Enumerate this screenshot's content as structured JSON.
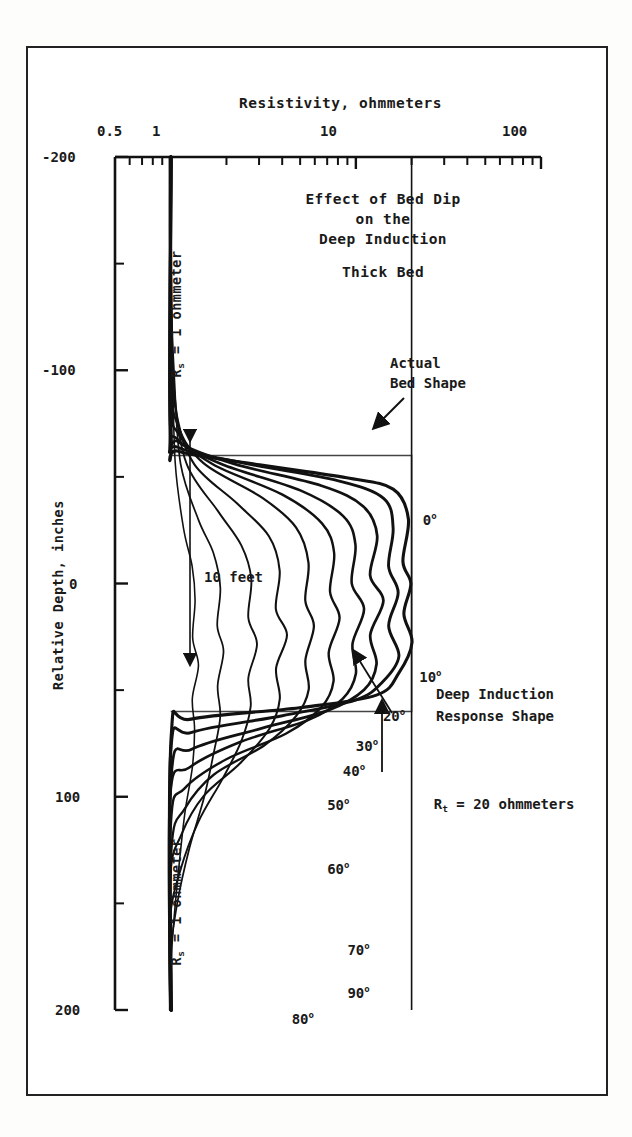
{
  "figure": {
    "title_lines": [
      "Effect of Bed Dip",
      "on the",
      "Deep Induction"
    ],
    "subtitle": "Thick Bed"
  },
  "annotations": {
    "actual_bed_shape": [
      "Actual",
      "Bed Shape"
    ],
    "response_shape": [
      "Deep Induction",
      "Response Shape"
    ],
    "rt_label": "R_t = 20 ohmmeters",
    "rt_label_pre": "R",
    "rt_label_sub": "t",
    "rt_label_post": " = 20 ohmmeters",
    "rs_label_pre": "R",
    "rs_label_sub": "s",
    "rs_label_post": " = 1 ohmmeter",
    "bed_thickness": "10 feet"
  },
  "chart_data": {
    "type": "line",
    "xlabel": "Resistivity, ohmmeters",
    "ylabel": "Relative Depth, inches",
    "xscale": "log",
    "xlim": [
      0.5,
      100
    ],
    "ylim": [
      -200,
      200
    ],
    "y_inverted": true,
    "grid": false,
    "legend": "inline curve labels",
    "xticks": [
      "0.5",
      "1",
      "10",
      "100"
    ],
    "xtick_values": [
      0.5,
      1,
      10,
      100
    ],
    "yticks": [
      "-200",
      "-100",
      "0",
      "100",
      "200"
    ],
    "ytick_values": [
      -200,
      -100,
      0,
      100,
      200
    ],
    "y_minor_tick_step": 50,
    "reference_lines": [
      {
        "name": "Rs shoulder resistivity",
        "x": 1,
        "label": "R_s = 1 ohmmeter"
      },
      {
        "name": "Rt bed resistivity",
        "x": 20,
        "label": "R_t = 20 ohmmeters"
      }
    ],
    "bed": {
      "name": "Actual Bed Shape",
      "top_depth": -60,
      "bottom_depth": 60,
      "thickness_label": "10 feet",
      "rs_ohmmeters": 1,
      "rt_ohmmeters": 20
    },
    "series": [
      {
        "name": "0 deg",
        "label": "0",
        "dip_degrees": 0,
        "points": [
          [
            1,
            -200
          ],
          [
            1,
            -70
          ],
          [
            1.1,
            -62
          ],
          [
            3,
            -56
          ],
          [
            9,
            -50
          ],
          [
            16,
            -44
          ],
          [
            19,
            -30
          ],
          [
            18,
            -10
          ],
          [
            20,
            0
          ],
          [
            18,
            14
          ],
          [
            20,
            28
          ],
          [
            17,
            42
          ],
          [
            13,
            52
          ],
          [
            5,
            58
          ],
          [
            1.3,
            64
          ],
          [
            1,
            72
          ],
          [
            1,
            200
          ]
        ]
      },
      {
        "name": "10 deg",
        "label": "10",
        "dip_degrees": 10,
        "points": [
          [
            1,
            -200
          ],
          [
            1,
            -74
          ],
          [
            1.1,
            -64
          ],
          [
            2.6,
            -56
          ],
          [
            8,
            -48
          ],
          [
            14,
            -40
          ],
          [
            16,
            -26
          ],
          [
            15,
            -8
          ],
          [
            17,
            4
          ],
          [
            15,
            20
          ],
          [
            17,
            34
          ],
          [
            14,
            46
          ],
          [
            10,
            55
          ],
          [
            4,
            62
          ],
          [
            1.3,
            70
          ],
          [
            1,
            80
          ],
          [
            1,
            200
          ]
        ]
      },
      {
        "name": "20 deg",
        "label": "20",
        "dip_degrees": 20,
        "points": [
          [
            1,
            -200
          ],
          [
            1,
            -78
          ],
          [
            1.1,
            -66
          ],
          [
            2.2,
            -56
          ],
          [
            6.5,
            -46
          ],
          [
            11,
            -36
          ],
          [
            13,
            -22
          ],
          [
            12,
            -4
          ],
          [
            14,
            8
          ],
          [
            12,
            24
          ],
          [
            13,
            38
          ],
          [
            11,
            50
          ],
          [
            7,
            60
          ],
          [
            3,
            68
          ],
          [
            1.3,
            78
          ],
          [
            1,
            90
          ],
          [
            1,
            200
          ]
        ]
      },
      {
        "name": "30 deg",
        "label": "30",
        "dip_degrees": 30,
        "points": [
          [
            1,
            -200
          ],
          [
            1,
            -84
          ],
          [
            1.1,
            -68
          ],
          [
            1.9,
            -56
          ],
          [
            5,
            -44
          ],
          [
            8.5,
            -32
          ],
          [
            10,
            -18
          ],
          [
            9.5,
            0
          ],
          [
            11,
            12
          ],
          [
            9.5,
            28
          ],
          [
            10,
            42
          ],
          [
            8.5,
            54
          ],
          [
            5.5,
            64
          ],
          [
            2.4,
            74
          ],
          [
            1.25,
            86
          ],
          [
            1,
            100
          ],
          [
            1,
            200
          ]
        ]
      },
      {
        "name": "40 deg",
        "label": "40",
        "dip_degrees": 40,
        "points": [
          [
            1,
            -200
          ],
          [
            1,
            -90
          ],
          [
            1.1,
            -70
          ],
          [
            1.7,
            -56
          ],
          [
            4,
            -42
          ],
          [
            6.5,
            -28
          ],
          [
            7.6,
            -14
          ],
          [
            7.2,
            4
          ],
          [
            8.2,
            16
          ],
          [
            7.2,
            32
          ],
          [
            7.6,
            46
          ],
          [
            6.5,
            58
          ],
          [
            4.2,
            70
          ],
          [
            2,
            82
          ],
          [
            1.2,
            96
          ],
          [
            1,
            112
          ],
          [
            1,
            200
          ]
        ]
      },
      {
        "name": "50 deg",
        "label": "50",
        "dip_degrees": 50,
        "points": [
          [
            1,
            -200
          ],
          [
            1,
            -98
          ],
          [
            1.1,
            -74
          ],
          [
            1.5,
            -56
          ],
          [
            3.1,
            -40
          ],
          [
            4.8,
            -26
          ],
          [
            5.6,
            -10
          ],
          [
            5.3,
            8
          ],
          [
            6,
            20
          ],
          [
            5.3,
            36
          ],
          [
            5.6,
            50
          ],
          [
            4.8,
            62
          ],
          [
            3.2,
            76
          ],
          [
            1.7,
            90
          ],
          [
            1.18,
            106
          ],
          [
            1,
            124
          ],
          [
            1,
            200
          ]
        ]
      },
      {
        "name": "60 deg",
        "label": "60",
        "dip_degrees": 60,
        "points": [
          [
            1,
            -200
          ],
          [
            1,
            -110
          ],
          [
            1.08,
            -80
          ],
          [
            1.35,
            -56
          ],
          [
            2.3,
            -38
          ],
          [
            3.4,
            -22
          ],
          [
            3.9,
            -6
          ],
          [
            3.7,
            12
          ],
          [
            4.2,
            24
          ],
          [
            3.7,
            40
          ],
          [
            3.9,
            54
          ],
          [
            3.4,
            68
          ],
          [
            2.4,
            84
          ],
          [
            1.5,
            100
          ],
          [
            1.15,
            118
          ],
          [
            1,
            138
          ],
          [
            1,
            200
          ]
        ]
      },
      {
        "name": "70 deg",
        "label": "70",
        "dip_degrees": 70,
        "points": [
          [
            1,
            -200
          ],
          [
            1,
            -126
          ],
          [
            1.06,
            -88
          ],
          [
            1.22,
            -56
          ],
          [
            1.8,
            -34
          ],
          [
            2.4,
            -18
          ],
          [
            2.7,
            -2
          ],
          [
            2.6,
            16
          ],
          [
            2.9,
            28
          ],
          [
            2.6,
            44
          ],
          [
            2.7,
            58
          ],
          [
            2.4,
            74
          ],
          [
            1.9,
            92
          ],
          [
            1.4,
            112
          ],
          [
            1.12,
            134
          ],
          [
            1,
            158
          ],
          [
            1,
            200
          ]
        ]
      },
      {
        "name": "80 deg",
        "label": "80",
        "dip_degrees": 80,
        "points": [
          [
            1,
            -200
          ],
          [
            1,
            -146
          ],
          [
            1.04,
            -96
          ],
          [
            1.12,
            -56
          ],
          [
            1.4,
            -30
          ],
          [
            1.7,
            -14
          ],
          [
            1.85,
            2
          ],
          [
            1.8,
            20
          ],
          [
            1.95,
            32
          ],
          [
            1.8,
            48
          ],
          [
            1.85,
            62
          ],
          [
            1.7,
            80
          ],
          [
            1.5,
            100
          ],
          [
            1.25,
            124
          ],
          [
            1.08,
            150
          ],
          [
            1,
            176
          ],
          [
            1,
            200
          ]
        ]
      },
      {
        "name": "90 deg",
        "label": "90",
        "dip_degrees": 90,
        "points": [
          [
            1,
            -200
          ],
          [
            1,
            -160
          ],
          [
            1.02,
            -100
          ],
          [
            1.06,
            -56
          ],
          [
            1.18,
            -26
          ],
          [
            1.3,
            -8
          ],
          [
            1.35,
            8
          ],
          [
            1.32,
            26
          ],
          [
            1.4,
            38
          ],
          [
            1.32,
            54
          ],
          [
            1.35,
            68
          ],
          [
            1.3,
            86
          ],
          [
            1.2,
            108
          ],
          [
            1.1,
            134
          ],
          [
            1.03,
            162
          ],
          [
            1,
            186
          ],
          [
            1,
            200
          ]
        ]
      }
    ],
    "curve_labels": [
      {
        "text": "0",
        "x": 23,
        "y": -30
      },
      {
        "text": "10",
        "x": 22,
        "y": 44
      },
      {
        "text": "20",
        "x": 14,
        "y": 62
      },
      {
        "text": "30",
        "x": 10,
        "y": 76
      },
      {
        "text": "40",
        "x": 8.5,
        "y": 88
      },
      {
        "text": "50",
        "x": 7,
        "y": 104
      },
      {
        "text": "60",
        "x": 7,
        "y": 134
      },
      {
        "text": "70",
        "x": 9,
        "y": 172
      },
      {
        "text": "90",
        "x": 9,
        "y": 192
      },
      {
        "text": "80",
        "x": 4.5,
        "y": 204
      }
    ]
  }
}
